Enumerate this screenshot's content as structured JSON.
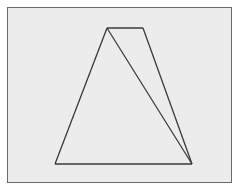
{
  "diagram": {
    "type": "geometry",
    "background_color": "#ececec",
    "frame_color": "#6a6a6a",
    "line_color": "#3a3a3a",
    "vertices": {
      "top_left": [
        107,
        28
      ],
      "top_right": [
        143,
        28
      ],
      "bottom_right": [
        192,
        164
      ],
      "bottom_left": [
        55,
        164
      ]
    },
    "segments": [
      {
        "name": "top-edge",
        "from": "top_left",
        "to": "top_right"
      },
      {
        "name": "right-edge",
        "from": "top_right",
        "to": "bottom_right"
      },
      {
        "name": "bottom-edge",
        "from": "bottom_right",
        "to": "bottom_left"
      },
      {
        "name": "left-edge",
        "from": "bottom_left",
        "to": "top_left"
      },
      {
        "name": "diagonal",
        "from": "top_left",
        "to": "bottom_right"
      }
    ],
    "labels": []
  }
}
